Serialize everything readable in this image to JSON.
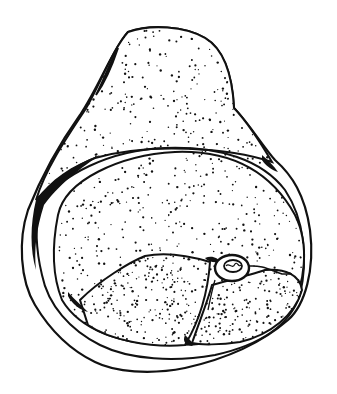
{
  "illustration": {
    "style": "stipple line drawing",
    "colors": {
      "ink": "#111111",
      "paper": "#ffffff"
    },
    "regions": [
      {
        "name": "upper-triangular-mass",
        "stipple": "medium"
      },
      {
        "name": "outer-ring-band",
        "stipple": "none"
      },
      {
        "name": "large-oval-body",
        "stipple": "medium"
      },
      {
        "name": "lower-left-lobe",
        "stipple": "medium"
      },
      {
        "name": "lower-right-lobe",
        "stipple": "medium"
      },
      {
        "name": "small-vessel",
        "stipple": "none"
      }
    ]
  }
}
